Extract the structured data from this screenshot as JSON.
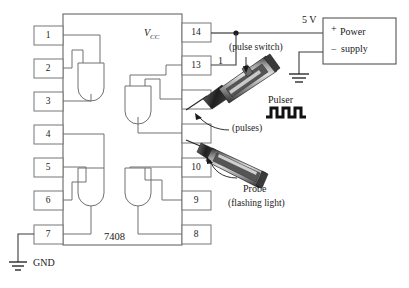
{
  "diagram": {
    "title_label": "7408 logic IC test setup with pulser and probe",
    "ic": {
      "name": "7408",
      "vcc_label": "V",
      "vcc_sub": "CC",
      "left_pins": [
        "1",
        "2",
        "3",
        "4",
        "5",
        "6",
        "7"
      ],
      "right_pins": [
        "14",
        "13",
        "",
        "",
        "10",
        "9",
        "8"
      ]
    },
    "ground": {
      "label": "GND"
    },
    "supply": {
      "voltage_label": "5 V",
      "plus_label": "+",
      "minus_label": "−",
      "box_line1": "Power",
      "box_line2": "supply"
    },
    "annotations": {
      "pulse_switch": "(pulse switch)",
      "pulser": "Pulser",
      "pulses": "(pulses)",
      "probe_line1": "Probe",
      "probe_line2": "(flashing light)",
      "wire_marker_one": "1"
    },
    "colors": {
      "line": "#555555",
      "text": "#1a1a1a",
      "wire": "#3a3a3a",
      "background": "#ffffff",
      "tool_dark": "#2b2b2b",
      "tool_mid": "#8c8c8c",
      "tool_light": "#d6d6d6"
    }
  }
}
